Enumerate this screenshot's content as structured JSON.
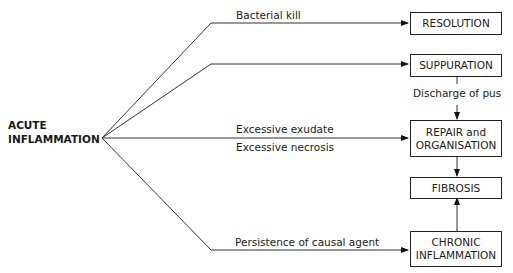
{
  "source": {
    "line1": "ACUTE",
    "line2": "INFLAMMATION"
  },
  "outcomes": {
    "resolution": "RESOLUTION",
    "suppuration": "SUPPURATION",
    "repair_line1": "REPAIR and",
    "repair_line2": "ORGANISATION",
    "fibrosis": "FIBROSIS",
    "chronic_line1": "CHRONIC",
    "chronic_line2": "INFLAMMATION"
  },
  "labels": {
    "bacterial_kill": "Bacterial kill",
    "discharge_of_pus": "Discharge of pus",
    "excessive_exudate": "Excessive exudate",
    "excessive_necrosis": "Excessive necrosis",
    "persistence": "Persistence of causal agent"
  }
}
